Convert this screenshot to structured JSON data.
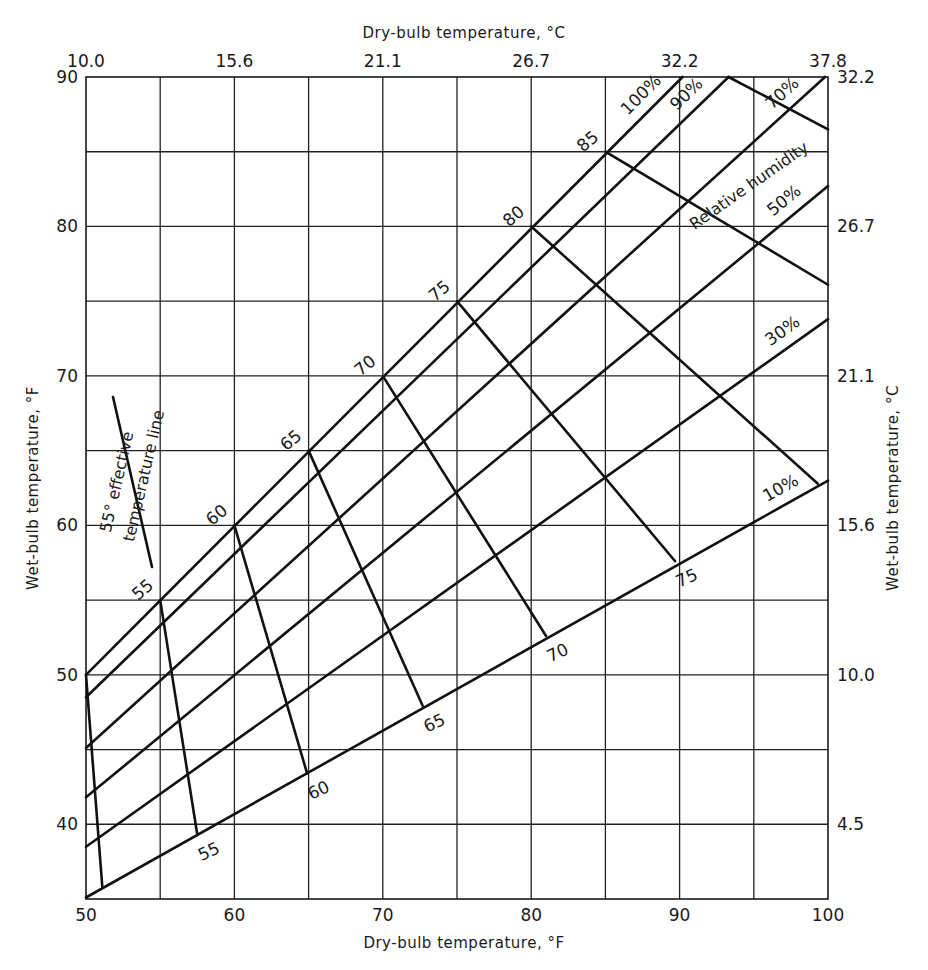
{
  "chart_data": {
    "type": "line",
    "xlabel": "Dry-bulb temperature, °F",
    "ylabel": "Wet-bulb temperature, °F",
    "x2label": "Dry-bulb temperature, °C",
    "y2label": "Wet-bulb temperature, °C",
    "xlim": [
      50,
      100
    ],
    "ylim": [
      35,
      90
    ],
    "grid": true,
    "x_ticks": [
      50,
      60,
      70,
      80,
      90,
      100
    ],
    "x_grid_step": 5,
    "y_ticks": [
      40,
      50,
      60,
      70,
      80,
      90
    ],
    "y_grid_step": 5,
    "x2_ticks": [
      {
        "at_F": 50,
        "label": "10.0"
      },
      {
        "at_F": 60,
        "label": "15.6"
      },
      {
        "at_F": 70,
        "label": "21.1"
      },
      {
        "at_F": 80,
        "label": "26.7"
      },
      {
        "at_F": 90,
        "label": "32.2"
      },
      {
        "at_F": 100,
        "label": "37.8"
      }
    ],
    "y2_ticks": [
      {
        "at_F": 40,
        "label": "4.5"
      },
      {
        "at_F": 50,
        "label": "10.0"
      },
      {
        "at_F": 60,
        "label": "15.6"
      },
      {
        "at_F": 70,
        "label": "21.1"
      },
      {
        "at_F": 80,
        "label": "26.7"
      },
      {
        "at_F": 90,
        "label": "32.2"
      }
    ],
    "relative_humidity_series": [
      {
        "name": "100%",
        "points": [
          [
            50,
            50.0
          ],
          [
            90.2,
            90
          ]
        ]
      },
      {
        "name": "90%",
        "points": [
          [
            50,
            48.5
          ],
          [
            93.3,
            90
          ]
        ]
      },
      {
        "name": "70%",
        "points": [
          [
            50,
            45.1
          ],
          [
            99.8,
            90
          ]
        ]
      },
      {
        "name": "50%",
        "points": [
          [
            50,
            41.8
          ],
          [
            100,
            82.7
          ]
        ]
      },
      {
        "name": "30%",
        "points": [
          [
            50,
            38.5
          ],
          [
            100,
            73.8
          ]
        ]
      },
      {
        "name": "10%",
        "points": [
          [
            50,
            35.1
          ],
          [
            100,
            63.0
          ]
        ]
      }
    ],
    "effective_temperature_series": [
      {
        "name": "50",
        "points": [
          [
            50,
            50
          ],
          [
            51.1,
            35.8
          ]
        ]
      },
      {
        "name": "55",
        "points": [
          [
            55,
            55
          ],
          [
            57.5,
            39.3
          ]
        ]
      },
      {
        "name": "60",
        "points": [
          [
            60,
            60
          ],
          [
            64.9,
            43.4
          ]
        ]
      },
      {
        "name": "65",
        "points": [
          [
            65,
            65
          ],
          [
            72.7,
            47.9
          ]
        ]
      },
      {
        "name": "70",
        "points": [
          [
            70,
            70
          ],
          [
            81.0,
            52.6
          ]
        ]
      },
      {
        "name": "75",
        "points": [
          [
            75,
            75
          ],
          [
            89.7,
            57.6
          ]
        ]
      },
      {
        "name": "80",
        "points": [
          [
            80,
            80
          ],
          [
            99.3,
            62.8
          ]
        ]
      },
      {
        "name": "85",
        "points": [
          [
            85,
            85
          ],
          [
            100,
            76.1
          ]
        ]
      },
      {
        "name": "90",
        "points": [
          [
            93.3,
            90
          ],
          [
            100,
            86.5
          ]
        ]
      }
    ],
    "annotations": [
      {
        "text": "Relative humidity",
        "at": [
          93.5,
          80.5
        ],
        "angle": -35
      },
      {
        "text": "55° effective",
        "at": [
          52.0,
          61.5
        ],
        "angle": -77
      },
      {
        "text": "temperature line",
        "at": [
          54.2,
          63.8
        ],
        "angle": -77
      }
    ],
    "legend_sample_line": {
      "points": [
        [
          51.8,
          68.1
        ],
        [
          54.4,
          56.7
        ]
      ],
      "label": "55° effective temperature line"
    }
  },
  "labels": {
    "top_title": "Dry-bulb temperature, °C",
    "bottom_title": "Dry-bulb temperature, °F",
    "left_title": "Wet-bulb temperature, °F",
    "right_title": "Wet-bulb temperature, °C",
    "relative_humidity": "Relative humidity",
    "legend_line1": "55° effective",
    "legend_line2": "temperature line"
  }
}
